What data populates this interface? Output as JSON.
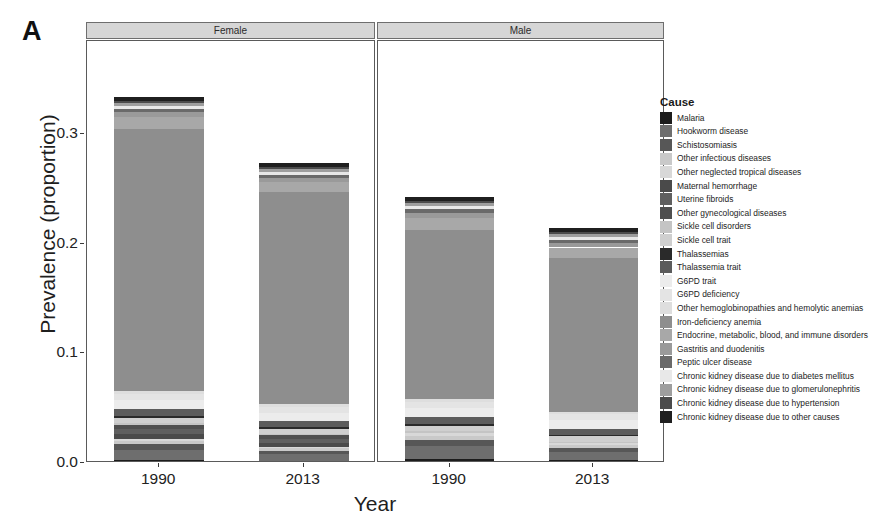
{
  "figure": {
    "panel_letter": "A"
  },
  "legend": {
    "title": "Cause"
  },
  "chart_data": {
    "type": "bar",
    "subtype": "stacked-bar",
    "title": "",
    "xlabel": "Year",
    "ylabel": "Prevalence (proportion)",
    "ylim": [
      0.0,
      0.385
    ],
    "yticks": [
      "0.0",
      "0.1",
      "0.2",
      "0.3"
    ],
    "ytick_values": [
      0.0,
      0.1,
      0.2,
      0.3
    ],
    "grid": false,
    "legend_position": "right",
    "facet_variable": "Sex",
    "facets": [
      "Female",
      "Male"
    ],
    "categories": [
      "1990",
      "2013"
    ],
    "series": [
      {
        "name": "Malaria",
        "color": "#1c1c1c",
        "values": {
          "Female|1990": 0.003,
          "Female|2013": 0.0022,
          "Male|1990": 0.0032,
          "Male|2013": 0.0024
        }
      },
      {
        "name": "Hookworm disease",
        "color": "#6e6e6e",
        "values": {
          "Female|1990": 0.0092,
          "Female|2013": 0.006,
          "Male|1990": 0.012,
          "Male|2013": 0.0074
        }
      },
      {
        "name": "Schistosomiasis",
        "color": "#575757",
        "values": {
          "Female|1990": 0.0048,
          "Female|2013": 0.003,
          "Male|1990": 0.0062,
          "Male|2013": 0.0038
        }
      },
      {
        "name": "Other infectious diseases",
        "color": "#c9c9c9",
        "values": {
          "Female|1990": 0.003,
          "Female|2013": 0.0022,
          "Male|1990": 0.0034,
          "Male|2013": 0.0026
        }
      },
      {
        "name": "Other neglected tropical diseases",
        "color": "#d8d8d8",
        "values": {
          "Female|1990": 0.0022,
          "Female|2013": 0.0016,
          "Male|1990": 0.0024,
          "Male|2013": 0.0018
        }
      },
      {
        "name": "Maternal hemorrhage",
        "color": "#4a4a4a",
        "values": {
          "Female|1990": 0.004,
          "Female|2013": 0.0028,
          "Male|1990": 0.0,
          "Male|2013": 0.0
        }
      },
      {
        "name": "Uterine fibroids",
        "color": "#5f5f5f",
        "values": {
          "Female|1990": 0.0046,
          "Female|2013": 0.004,
          "Male|1990": 0.0,
          "Male|2013": 0.0
        }
      },
      {
        "name": "Other gynecological diseases",
        "color": "#4f4f4f",
        "values": {
          "Female|1990": 0.004,
          "Female|2013": 0.0034,
          "Male|1990": 0.0,
          "Male|2013": 0.0
        }
      },
      {
        "name": "Sickle cell disorders",
        "color": "#c4c4c4",
        "values": {
          "Female|1990": 0.0016,
          "Female|2013": 0.0014,
          "Male|1990": 0.0016,
          "Male|2013": 0.0014
        }
      },
      {
        "name": "Sickle cell trait",
        "color": "#cfcfcf",
        "values": {
          "Female|1990": 0.005,
          "Female|2013": 0.0048,
          "Male|1990": 0.005,
          "Male|2013": 0.0048
        }
      },
      {
        "name": "Thalassemias",
        "color": "#2a2a2a",
        "values": {
          "Female|1990": 0.0016,
          "Female|2013": 0.0014,
          "Male|1990": 0.0016,
          "Male|2013": 0.0014
        }
      },
      {
        "name": "Thalassemia trait",
        "color": "#5c5c5c",
        "values": {
          "Female|1990": 0.0062,
          "Female|2013": 0.0056,
          "Male|1990": 0.0062,
          "Male|2013": 0.0056
        }
      },
      {
        "name": "G6PD trait",
        "color": "#ececec",
        "values": {
          "Female|1990": 0.008,
          "Female|2013": 0.0074,
          "Male|1990": 0.0082,
          "Male|2013": 0.0076
        }
      },
      {
        "name": "G6PD deficiency",
        "color": "#e4e4e4",
        "values": {
          "Female|1990": 0.006,
          "Female|2013": 0.0056,
          "Male|1990": 0.006,
          "Male|2013": 0.0056
        }
      },
      {
        "name": "Other hemoglobinopathies and hemolytic anemias",
        "color": "#dedede",
        "values": {
          "Female|1990": 0.0026,
          "Female|2013": 0.0024,
          "Male|1990": 0.0026,
          "Male|2013": 0.0024
        }
      },
      {
        "name": "Iron-deficiency anemia",
        "color": "#8e8e8e",
        "values": {
          "Female|1990": 0.239,
          "Female|2013": 0.193,
          "Male|1990": 0.154,
          "Male|2013": 0.14
        }
      },
      {
        "name": "Endocrine, metabolic, blood, and immune disorders",
        "color": "#a8a8a8",
        "values": {
          "Female|1990": 0.011,
          "Female|2013": 0.0096,
          "Male|1990": 0.011,
          "Male|2013": 0.0098
        }
      },
      {
        "name": "Gastritis and duodenitis",
        "color": "#9a9a9a",
        "values": {
          "Female|1990": 0.0046,
          "Female|2013": 0.004,
          "Male|1990": 0.0048,
          "Male|2013": 0.0042
        }
      },
      {
        "name": "Peptic ulcer disease",
        "color": "#6a6a6a",
        "values": {
          "Female|1990": 0.003,
          "Female|2013": 0.0022,
          "Male|1990": 0.0036,
          "Male|2013": 0.0026
        }
      },
      {
        "name": "Chronic kidney disease due to diabetes mellitus",
        "color": "#e8e8e8",
        "values": {
          "Female|1990": 0.0024,
          "Female|2013": 0.003,
          "Male|1990": 0.0024,
          "Male|2013": 0.003
        }
      },
      {
        "name": "Chronic kidney disease due to glomerulonephritis",
        "color": "#9e9e9e",
        "values": {
          "Female|1990": 0.0028,
          "Female|2013": 0.0026,
          "Male|1990": 0.0028,
          "Male|2013": 0.0026
        }
      },
      {
        "name": "Chronic kidney disease due to hypertension",
        "color": "#4b4b4b",
        "values": {
          "Female|1990": 0.0016,
          "Female|2013": 0.0018,
          "Male|1990": 0.0016,
          "Male|2013": 0.0018
        }
      },
      {
        "name": "Chronic kidney disease due to other causes",
        "color": "#1f1f1f",
        "values": {
          "Female|1990": 0.0038,
          "Female|2013": 0.004,
          "Male|1990": 0.0038,
          "Male|2013": 0.004
        }
      }
    ],
    "totals": {
      "Female|1990": 0.368,
      "Female|2013": 0.309,
      "Male|1990": 0.337,
      "Male|2013": 0.228
    }
  }
}
